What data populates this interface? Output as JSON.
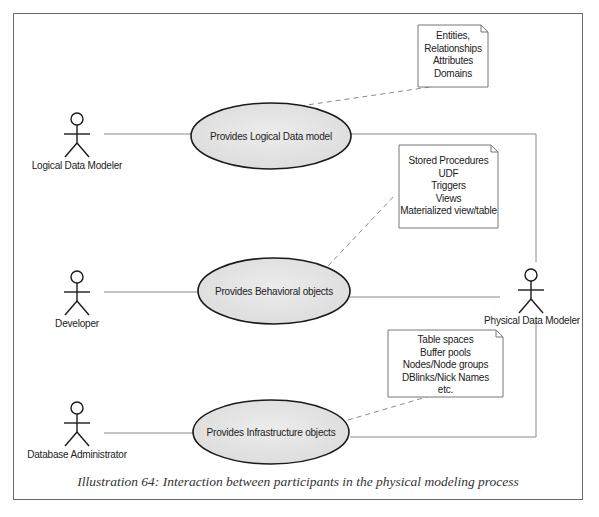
{
  "diagram": {
    "type": "uml-use-case",
    "actors": [
      {
        "id": "logical-data-modeler",
        "label": "Logical Data Modeler"
      },
      {
        "id": "developer",
        "label": "Developer"
      },
      {
        "id": "database-administrator",
        "label": "Database Administrator"
      },
      {
        "id": "physical-data-modeler",
        "label": "Physical Data Modeler"
      }
    ],
    "use_cases": [
      {
        "id": "logical",
        "label": "Provides Logical Data model"
      },
      {
        "id": "behavioral",
        "label": "Provides Behavioral objects"
      },
      {
        "id": "infrastructure",
        "label": "Provides Infrastructure objects"
      }
    ],
    "notes": [
      {
        "id": "logical-note",
        "lines": [
          "Entities,",
          "Relationships",
          "Attributes",
          "Domains"
        ]
      },
      {
        "id": "behavioral-note",
        "lines": [
          "Stored Procedures",
          "UDF",
          "Triggers",
          "Views",
          "Materialized view/table"
        ]
      },
      {
        "id": "infrastructure-note",
        "lines": [
          "Table spaces",
          "Buffer pools",
          "Nodes/Node groups",
          "DBlinks/Nick Names",
          "etc."
        ]
      }
    ],
    "associations": [
      {
        "from": "logical-data-modeler",
        "to": "logical"
      },
      {
        "from": "developer",
        "to": "behavioral"
      },
      {
        "from": "database-administrator",
        "to": "infrastructure"
      },
      {
        "from": "logical",
        "to": "physical-data-modeler"
      },
      {
        "from": "behavioral",
        "to": "physical-data-modeler"
      },
      {
        "from": "infrastructure",
        "to": "physical-data-modeler"
      }
    ],
    "note_links": [
      {
        "note": "logical-note",
        "to": "logical"
      },
      {
        "note": "behavioral-note",
        "to": "behavioral"
      },
      {
        "note": "infrastructure-note",
        "to": "infrastructure"
      }
    ],
    "colors": {
      "ellipse_fill": "#e4e4e4",
      "ellipse_stroke": "#1a1a1a",
      "line": "#8a8a8a",
      "frame": "#6a6a6a"
    }
  },
  "caption": "Illustration 64: Interaction between participants in the physical modeling process"
}
